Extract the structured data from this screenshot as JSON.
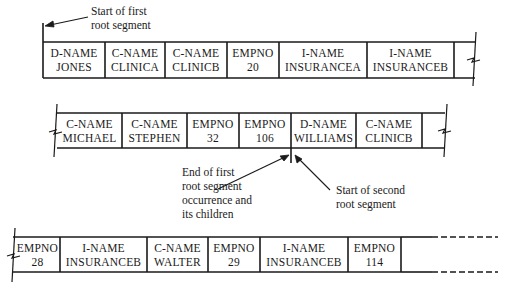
{
  "annotations": {
    "start_first_root": [
      "Start of first",
      "root segment"
    ],
    "end_first_root": [
      "End of first",
      "root segment",
      "occurrence and",
      "its children"
    ],
    "start_second_root": [
      "Start of second",
      "root segment"
    ]
  },
  "rows": [
    {
      "cells": [
        {
          "field": "D-NAME",
          "value": "JONES"
        },
        {
          "field": "C-NAME",
          "value": "CLINICA"
        },
        {
          "field": "C-NAME",
          "value": "CLINICB"
        },
        {
          "field": "EMPNO",
          "value": "20"
        },
        {
          "field": "I-NAME",
          "value": "INSURANCEA"
        },
        {
          "field": "I-NAME",
          "value": "INSURANCEB"
        }
      ]
    },
    {
      "cells": [
        {
          "field": "C-NAME",
          "value": "MICHAEL"
        },
        {
          "field": "C-NAME",
          "value": "STEPHEN"
        },
        {
          "field": "EMPNO",
          "value": "32"
        },
        {
          "field": "EMPNO",
          "value": "106"
        },
        {
          "field": "D-NAME",
          "value": "WILLIAMS"
        },
        {
          "field": "C-NAME",
          "value": "CLINICB"
        }
      ]
    },
    {
      "cells": [
        {
          "field": "EMPNO",
          "value": "28"
        },
        {
          "field": "I-NAME",
          "value": "INSURANCEB"
        },
        {
          "field": "C-NAME",
          "value": "WALTER"
        },
        {
          "field": "EMPNO",
          "value": "29"
        },
        {
          "field": "I-NAME",
          "value": "INSURANCEB"
        },
        {
          "field": "EMPNO",
          "value": "114"
        }
      ]
    }
  ]
}
